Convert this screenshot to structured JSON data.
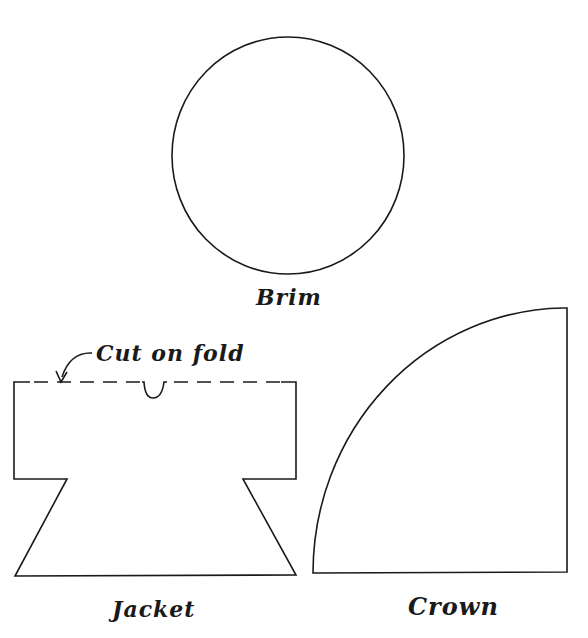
{
  "figure": {
    "pieces": [
      {
        "id": "brim",
        "label": "Brim",
        "shape": "circle"
      },
      {
        "id": "jacket",
        "label": "Jacket",
        "shape": "polygon-with-fold"
      },
      {
        "id": "crown",
        "label": "Crown",
        "shape": "quarter-circle"
      }
    ],
    "annotations": {
      "fold_note": "Cut on fold"
    },
    "colors": {
      "line": "#1a1a1a",
      "background": "#ffffff"
    }
  }
}
